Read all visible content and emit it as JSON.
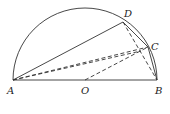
{
  "diagram": {
    "type": "geometry",
    "colors": {
      "stroke": "#333333",
      "background": "#ffffff"
    },
    "points": {
      "A": {
        "label": "A",
        "x": 13,
        "y": 80
      },
      "O": {
        "label": "O",
        "x": 85,
        "y": 80
      },
      "B": {
        "label": "B",
        "x": 157,
        "y": 80
      },
      "C": {
        "label": "C",
        "x": 148,
        "y": 47
      },
      "D": {
        "label": "D",
        "x": 123,
        "y": 22
      }
    },
    "solid_segments": [
      "AB",
      "AD",
      "DC",
      "CB"
    ],
    "dashed_segments": [
      "AC",
      "OC",
      "DB"
    ],
    "arc": "semicircle over AB"
  }
}
